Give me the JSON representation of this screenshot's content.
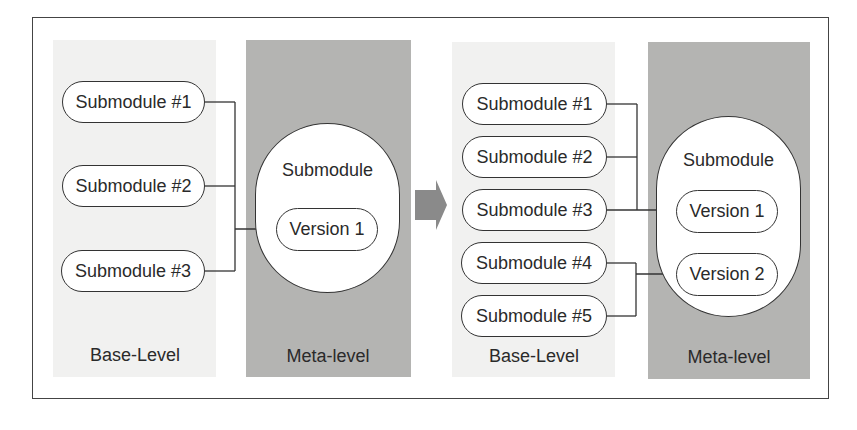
{
  "diagram": {
    "before": {
      "base_label": "Base-Level",
      "meta_label": "Meta-level",
      "submodules": [
        "Submodule #1",
        "Submodule #2",
        "Submodule #3"
      ],
      "meta_module": {
        "title": "Submodule",
        "versions": [
          "Version 1"
        ]
      },
      "connections": [
        {
          "from": [
            "Submodule #1",
            "Submodule #2",
            "Submodule #3"
          ],
          "to": "Version 1"
        }
      ]
    },
    "arrow": {
      "direction": "right",
      "color": "#8a8a8a"
    },
    "after": {
      "base_label": "Base-Level",
      "meta_label": "Meta-level",
      "submodules": [
        "Submodule #1",
        "Submodule #2",
        "Submodule #3",
        "Submodule #4",
        "Submodule #5"
      ],
      "meta_module": {
        "title": "Submodule",
        "versions": [
          "Version 1",
          "Version 2"
        ]
      },
      "connections": [
        {
          "from": [
            "Submodule #1",
            "Submodule #2",
            "Submodule #3"
          ],
          "to": "Version 1"
        },
        {
          "from": [
            "Submodule #4",
            "Submodule #5"
          ],
          "to": "Version 2"
        }
      ]
    },
    "colors": {
      "meta_background": "#b4b4b2",
      "base_background": "#f1f1f0",
      "stroke": "#333333"
    }
  }
}
